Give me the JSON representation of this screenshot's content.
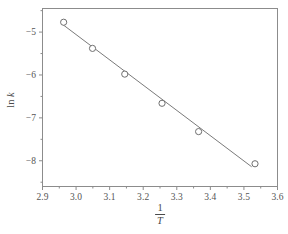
{
  "chart_data": {
    "type": "scatter",
    "title": "",
    "subtitle": "",
    "xlabel": "1/T",
    "xlabel_numerator": "1",
    "xlabel_denominator": "T",
    "ylabel": "ln k",
    "ylabel_prefix": "ln ",
    "ylabel_italic": "k",
    "xlim": [
      2.9,
      3.6
    ],
    "ylim": [
      -8.6,
      -4.45
    ],
    "xticks": [
      2.9,
      3.0,
      3.1,
      3.2,
      3.3,
      3.4,
      3.5,
      3.6
    ],
    "xtick_labels": [
      "2.9",
      "3.0",
      "3.1",
      "3.2",
      "3.3",
      "3.4",
      "3.5",
      "3.6"
    ],
    "xminor_step": 0.05,
    "yticks": [
      -5,
      -6,
      -7,
      -8
    ],
    "ytick_labels": [
      "−5",
      "−6",
      "−7",
      "−8"
    ],
    "yminor_step": 0.5,
    "grid": false,
    "legend": null,
    "marker": "open-circle",
    "points": [
      {
        "x": 2.963,
        "y": -4.77
      },
      {
        "x": 3.049,
        "y": -5.38
      },
      {
        "x": 3.145,
        "y": -5.98
      },
      {
        "x": 3.256,
        "y": -6.66
      },
      {
        "x": 3.365,
        "y": -7.32
      },
      {
        "x": 3.533,
        "y": -8.07
      }
    ],
    "series": [
      {
        "name": "data",
        "x": [
          2.963,
          3.049,
          3.145,
          3.256,
          3.365,
          3.533
        ],
        "values": [
          -4.77,
          -5.38,
          -5.98,
          -6.66,
          -7.32,
          -8.07
        ]
      }
    ],
    "fit_line": {
      "type": "linear",
      "x_start": 2.958,
      "y_start": -4.81,
      "x_end": 3.523,
      "y_end": -8.14
    },
    "colors": {
      "axis": "#8c8c8c",
      "line": "#7a7a7a",
      "marker_stroke": "#6f6f6f",
      "marker_fill": "#ffffff",
      "text": "#4a4a4a",
      "background": "#ffffff"
    }
  }
}
